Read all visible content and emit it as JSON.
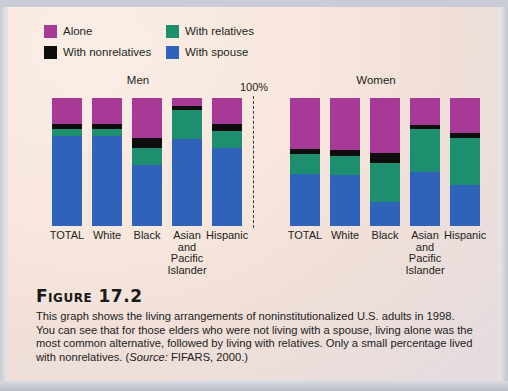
{
  "legend": {
    "items": [
      {
        "label": "Alone",
        "color": "#a63a96",
        "key": "alone"
      },
      {
        "label": "With relatives",
        "color": "#1d8f6e",
        "key": "relatives"
      },
      {
        "label": "With nonrelatives",
        "color": "#0d0d0d",
        "key": "nonrelatives"
      },
      {
        "label": "With spouse",
        "color": "#2f63ba",
        "key": "spouse"
      }
    ]
  },
  "axis": {
    "scale_label": "100%"
  },
  "groups": [
    {
      "title": "Men"
    },
    {
      "title": "Women"
    }
  ],
  "categories": [
    "TOTAL",
    "White",
    "Black",
    "Asian and Pacific Islander",
    "Hispanic"
  ],
  "category_lines": [
    [
      "TOTAL"
    ],
    [
      "White"
    ],
    [
      "Black"
    ],
    [
      "Asian",
      "and",
      "Pacific",
      "Islander"
    ],
    [
      "Hispanic"
    ]
  ],
  "caption": {
    "figure_number": "Figure 17.2",
    "body_before_source": "This graph shows the living arrangements of noninstitutionalized U.S. adults in 1998. You can see that for those elders who were not living with a spouse, living alone was the most common alternative, followed by living with relatives. Only a small percentage lived with nonrelatives. (",
    "source_prefix": "Source:",
    "source_value": " FIFARS, 2000.)"
  },
  "chart_data": {
    "type": "bar",
    "stacked": true,
    "stack_total": 100,
    "title": "Figure 17.2",
    "xlabel": "",
    "ylabel": "Percent",
    "ylim": [
      0,
      100
    ],
    "grid": false,
    "legend_position": "top-left",
    "units": "percent",
    "categories": [
      "TOTAL",
      "White",
      "Black",
      "Asian and Pacific Islander",
      "Hispanic"
    ],
    "panels": [
      {
        "name": "Men",
        "series": [
          {
            "name": "Alone",
            "color": "#a63a96",
            "values": [
              20,
              20,
              31,
              6,
              20
            ]
          },
          {
            "name": "With nonrelatives",
            "color": "#0d0d0d",
            "values": [
              4,
              4,
              8,
              3,
              6
            ]
          },
          {
            "name": "With relatives",
            "color": "#1d8f6e",
            "values": [
              6,
              6,
              13,
              23,
              13
            ]
          },
          {
            "name": "With spouse",
            "color": "#2f63ba",
            "values": [
              70,
              70,
              48,
              68,
              61
            ]
          }
        ]
      },
      {
        "name": "Women",
        "series": [
          {
            "name": "Alone",
            "color": "#a63a96",
            "values": [
              40,
              41,
              43,
              21,
              27
            ]
          },
          {
            "name": "With nonrelatives",
            "color": "#0d0d0d",
            "values": [
              4,
              4,
              8,
              3,
              4
            ]
          },
          {
            "name": "With relatives",
            "color": "#1d8f6e",
            "values": [
              15,
              15,
              30,
              34,
              37
            ]
          },
          {
            "name": "With spouse",
            "color": "#2f63ba",
            "values": [
              41,
              40,
              19,
              42,
              32
            ]
          }
        ]
      }
    ]
  }
}
